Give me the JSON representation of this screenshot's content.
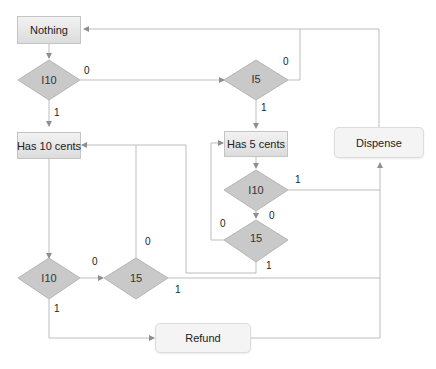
{
  "diagram": {
    "type": "flowchart",
    "colors": {
      "line": "#b8b8b8",
      "arrow": "#8f8f8f",
      "diamond_fill": "#c8c8c8",
      "state_fill": "#e4e4e4",
      "action_fill": "#f4f4f4"
    },
    "states": [
      {
        "id": "nothing",
        "label": "Nothing"
      },
      {
        "id": "has10",
        "label": "Has 10 cents"
      },
      {
        "id": "has5",
        "label": "Has 5 cents"
      }
    ],
    "actions": [
      {
        "id": "dispense",
        "label": "Dispense"
      },
      {
        "id": "refund",
        "label": "Refund"
      }
    ],
    "decisions": [
      {
        "id": "d1",
        "label": "I10"
      },
      {
        "id": "d2",
        "label": "I5"
      },
      {
        "id": "d3",
        "label": "I10"
      },
      {
        "id": "d4",
        "label": "15"
      },
      {
        "id": "d5",
        "label": "I10"
      },
      {
        "id": "d6",
        "label": "15"
      }
    ],
    "edge_labels": {
      "d1_0": "0",
      "d1_1": "1",
      "d2_0": "0",
      "d2_1": "1",
      "d3_1": "1",
      "d3_0": "0",
      "d4_0": "0",
      "d4_1": "1",
      "d5_0": "0",
      "d5_1": "1",
      "d6_0": "0",
      "d6_1": "1"
    },
    "edges": [
      {
        "from": "nothing",
        "to": "d1"
      },
      {
        "from": "d1",
        "to": "has10",
        "label": "1"
      },
      {
        "from": "d1",
        "to": "d2",
        "label": "0"
      },
      {
        "from": "d2",
        "to": "has5",
        "label": "1"
      },
      {
        "from": "d2",
        "to": "dispense",
        "label": "0"
      },
      {
        "from": "dispense",
        "to": "nothing"
      },
      {
        "from": "has5",
        "to": "d3"
      },
      {
        "from": "d3",
        "to": "dispense",
        "label": "1"
      },
      {
        "from": "d3",
        "to": "d4",
        "label": "0"
      },
      {
        "from": "d4",
        "to": "has5",
        "label": "0"
      },
      {
        "from": "d4",
        "to": "has10",
        "label": "1"
      },
      {
        "from": "has10",
        "to": "d5"
      },
      {
        "from": "d5",
        "to": "d6",
        "label": "0"
      },
      {
        "from": "d5",
        "to": "refund",
        "label": "1"
      },
      {
        "from": "d6",
        "to": "has10",
        "label": "0"
      },
      {
        "from": "d6",
        "to": "dispense",
        "label": "1"
      },
      {
        "from": "refund",
        "to": "dispense"
      }
    ]
  }
}
